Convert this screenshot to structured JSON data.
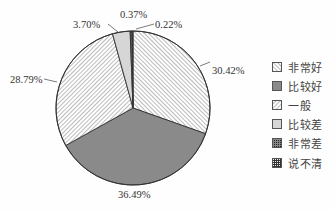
{
  "chart_data": {
    "type": "pie",
    "title": "",
    "start_angle_deg": 0,
    "direction": "clockwise",
    "categories": [
      "非常好",
      "比较好",
      "一般",
      "比较差",
      "非常差",
      "说不清"
    ],
    "values": [
      30.42,
      36.49,
      28.79,
      3.7,
      0.37,
      0.22
    ],
    "labels": [
      "30.42%",
      "36.49%",
      "28.79%",
      "3.70%",
      "0.37%",
      "0.22%"
    ],
    "legend_position": "right",
    "fills": [
      "hatch-backslash",
      "solid-gray",
      "hatch-forward",
      "light-gray",
      "cross-hatch",
      "grid"
    ],
    "colors": [
      "#ffffff",
      "#8a8a8a",
      "#ffffff",
      "#d6d6d6",
      "#555555",
      "#444444"
    ]
  },
  "legend": {
    "items": [
      {
        "label": "非常好"
      },
      {
        "label": "比较好"
      },
      {
        "label": "一般"
      },
      {
        "label": "比较差"
      },
      {
        "label": "非常差"
      },
      {
        "label": "说不清"
      }
    ]
  }
}
